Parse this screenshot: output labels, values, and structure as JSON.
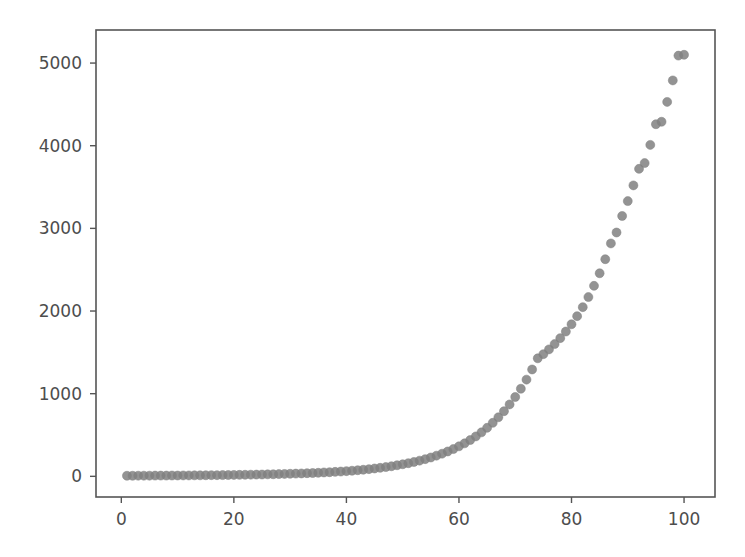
{
  "figure": {
    "background_color": "#ffffff",
    "axes_box": {
      "left": 96,
      "top": 30,
      "right": 715,
      "bottom": 497
    },
    "spine_color": "#555555",
    "tick_label_color": "#4d4d4d"
  },
  "chart_data": {
    "type": "scatter",
    "title": "",
    "xlabel": "",
    "ylabel": "",
    "xlim": [
      -4.5,
      105.5
    ],
    "ylim": [
      -250,
      5400
    ],
    "grid": false,
    "legend": null,
    "marker": {
      "shape": "circle",
      "color": "#808080",
      "size_px": 9,
      "opacity": 0.85,
      "edge_color": "#808080"
    },
    "xticks": [
      0,
      20,
      40,
      60,
      80,
      100
    ],
    "xtick_labels": [
      "0",
      "20",
      "40",
      "60",
      "80",
      "100"
    ],
    "yticks": [
      0,
      1000,
      2000,
      3000,
      4000,
      5000
    ],
    "ytick_labels": [
      "0",
      "1000",
      "2000",
      "3000",
      "4000",
      "5000"
    ],
    "n_points": 100,
    "x": [
      1,
      2,
      3,
      4,
      5,
      6,
      7,
      8,
      9,
      10,
      11,
      12,
      13,
      14,
      15,
      16,
      17,
      18,
      19,
      20,
      21,
      22,
      23,
      24,
      25,
      26,
      27,
      28,
      29,
      30,
      31,
      32,
      33,
      34,
      35,
      36,
      37,
      38,
      39,
      40,
      41,
      42,
      43,
      44,
      45,
      46,
      47,
      48,
      49,
      50,
      51,
      52,
      53,
      54,
      55,
      56,
      57,
      58,
      59,
      60,
      61,
      62,
      63,
      64,
      65,
      66,
      67,
      68,
      69,
      70,
      71,
      72,
      73,
      74,
      75,
      76,
      77,
      78,
      79,
      80,
      81,
      82,
      83,
      84,
      85,
      86,
      87,
      88,
      89,
      90,
      91,
      92,
      93,
      94,
      95,
      96,
      97,
      98,
      99,
      100
    ],
    "y": [
      7,
      7,
      8,
      8,
      8,
      9,
      9,
      9,
      10,
      10,
      11,
      11,
      12,
      12,
      13,
      14,
      14,
      15,
      16,
      17,
      18,
      19,
      20,
      21,
      22,
      24,
      25,
      27,
      29,
      31,
      33,
      35,
      38,
      40,
      43,
      47,
      50,
      54,
      58,
      63,
      68,
      74,
      80,
      87,
      95,
      103,
      112,
      122,
      134,
      146,
      159,
      174,
      190,
      208,
      228,
      250,
      274,
      301,
      330,
      363,
      399,
      439,
      483,
      532,
      587,
      647,
      714,
      788,
      870,
      960,
      1060,
      1170,
      1293,
      1428,
      1478,
      1536,
      1600,
      1672,
      1752,
      1840,
      1938,
      2047,
      2169,
      2305,
      2457,
      2627,
      2818,
      2950,
      3150,
      3330,
      3520,
      3720,
      3790,
      4010,
      4260,
      4290,
      4530,
      4790,
      5090,
      5100
    ]
  },
  "icons": {
    "chart_icon": "scatter-plot-icon"
  }
}
